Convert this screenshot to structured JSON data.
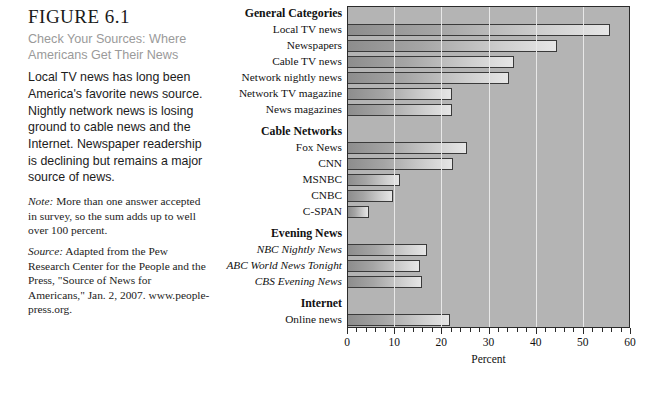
{
  "caption": {
    "figure_number": "FIGURE 6.1",
    "subtitle": "Check Your Sources: Where Americans Get Their News",
    "body": "Local TV news has long been America's favorite news source. Nightly network news is losing ground to cable news and the Internet. Newspaper readership is declining but remains a major source of news.",
    "note_label": "Note:",
    "note_text": " More than one answer accepted in survey, so the sum adds up to well over 100 percent.",
    "source_label": "Source:",
    "source_text": " Adapted from the Pew Research Center for the People and the Press, \"Source of News for Americans,\" Jan. 2, 2007. www.people-press.org."
  },
  "chart_data": {
    "type": "bar",
    "orientation": "horizontal",
    "title": "",
    "xlabel": "Percent",
    "ylabel": "",
    "xlim": [
      0,
      60
    ],
    "xticks": [
      0,
      10,
      20,
      30,
      40,
      50,
      60
    ],
    "xtick_labels": [
      "0",
      "10",
      "20",
      "30",
      "40",
      "50",
      "60"
    ],
    "minor_tick_step": 2,
    "grid": true,
    "grid_axis": "x",
    "legend": "none",
    "bar_fill": "#b9b9b9",
    "plot_background": "#b4b4b4",
    "groups": [
      {
        "name": "General Categories",
        "items": [
          {
            "label": "Local TV news",
            "value": 55.7
          },
          {
            "label": "Newspapers",
            "value": 44.5
          },
          {
            "label": "Cable TV news",
            "value": 35.4
          },
          {
            "label": "Network nightly news",
            "value": 34.3
          },
          {
            "label": "Network TV magazine",
            "value": 22.2
          },
          {
            "label": "News magazines",
            "value": 22.2
          }
        ]
      },
      {
        "name": "Cable Networks",
        "items": [
          {
            "label": "Fox News",
            "value": 25.4
          },
          {
            "label": "CNN",
            "value": 22.5
          },
          {
            "label": "MSNBC",
            "value": 11.2
          },
          {
            "label": "CNBC",
            "value": 9.8
          },
          {
            "label": "C-SPAN",
            "value": 4.7
          }
        ]
      },
      {
        "name": "Evening News",
        "italic_labels": true,
        "items": [
          {
            "label": "NBC Nightly News",
            "value": 17.0
          },
          {
            "label": "ABC World News Tonight",
            "value": 15.4
          },
          {
            "label": "CBS Evening News",
            "value": 16.0
          }
        ]
      },
      {
        "name": "Internet",
        "items": [
          {
            "label": "Online news",
            "value": 21.8
          }
        ]
      }
    ]
  }
}
